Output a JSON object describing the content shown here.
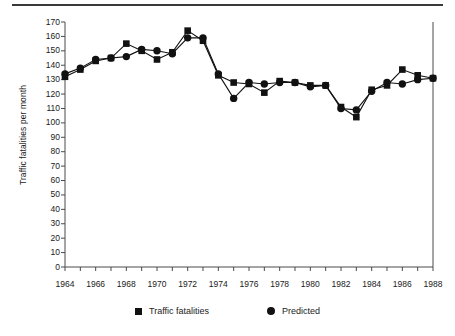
{
  "chart_data": {
    "type": "line",
    "title": "",
    "xlabel": "",
    "ylabel": "Traffic fatalities per month",
    "xlim": [
      1964,
      1988
    ],
    "ylim": [
      0,
      170
    ],
    "ytick_step": 10,
    "yticks": [
      0,
      10,
      20,
      30,
      40,
      50,
      60,
      70,
      80,
      90,
      100,
      110,
      120,
      130,
      140,
      150,
      160,
      170
    ],
    "ytick_labels": [
      "0",
      "10",
      "20",
      "30",
      "40",
      "50",
      "60",
      "70",
      "80",
      "90",
      "100",
      "110",
      "120",
      "130",
      "140",
      "150",
      "160",
      "170"
    ],
    "x_minor_ticks_every": 1,
    "xticks": [
      1964,
      1966,
      1968,
      1970,
      1972,
      1974,
      1976,
      1978,
      1980,
      1982,
      1984,
      1986,
      1988
    ],
    "xtick_labels": [
      "1964",
      "1966",
      "1968",
      "1970",
      "1972",
      "1974",
      "1976",
      "1978",
      "1980",
      "1982",
      "1984",
      "1986",
      "1988"
    ],
    "grid": false,
    "legend_position": "bottom-center",
    "x": [
      1964,
      1965,
      1966,
      1967,
      1968,
      1969,
      1970,
      1971,
      1972,
      1973,
      1974,
      1975,
      1976,
      1977,
      1978,
      1979,
      1980,
      1981,
      1982,
      1983,
      1984,
      1985,
      1986,
      1987,
      1988
    ],
    "series": [
      {
        "name": "Traffic fatalities",
        "marker": "square",
        "color": "#111111",
        "values": [
          132,
          137,
          143,
          145,
          155,
          150,
          144,
          149,
          164,
          157,
          133,
          128,
          127,
          121,
          129,
          128,
          126,
          126,
          111,
          104,
          123,
          126,
          137,
          133,
          131
        ]
      },
      {
        "name": "Predicted",
        "marker": "circle",
        "color": "#111111",
        "values": [
          134,
          138,
          144,
          145,
          146,
          151,
          150,
          148,
          159,
          159,
          134,
          117,
          128,
          127,
          128,
          128,
          125,
          126,
          110,
          109,
          122,
          128,
          127,
          130,
          131
        ]
      }
    ]
  },
  "legend": {
    "items": [
      {
        "label": "Traffic fatalities",
        "marker": "square"
      },
      {
        "label": "Predicted",
        "marker": "circle"
      }
    ]
  }
}
